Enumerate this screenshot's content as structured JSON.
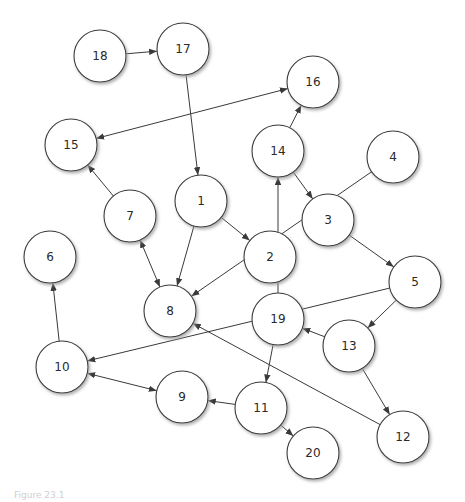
{
  "diagram": {
    "type": "directed-graph",
    "node_radius": 26,
    "colors": {
      "node_fill": "#ffffff",
      "node_stroke": "#3a3a3a",
      "edge": "#3a3a3a",
      "text": "#2a2a2a",
      "shadow": "#9a9a9a"
    },
    "nodes": [
      {
        "id": "1",
        "label": "1",
        "x": 201,
        "y": 201
      },
      {
        "id": "2",
        "label": "2",
        "x": 270,
        "y": 257
      },
      {
        "id": "3",
        "label": "3",
        "x": 328,
        "y": 220
      },
      {
        "id": "4",
        "label": "4",
        "x": 393,
        "y": 157
      },
      {
        "id": "5",
        "label": "5",
        "x": 415,
        "y": 282
      },
      {
        "id": "6",
        "label": "6",
        "x": 50,
        "y": 257
      },
      {
        "id": "7",
        "label": "7",
        "x": 130,
        "y": 216
      },
      {
        "id": "8",
        "label": "8",
        "x": 170,
        "y": 311
      },
      {
        "id": "9",
        "label": "9",
        "x": 182,
        "y": 397
      },
      {
        "id": "10",
        "label": "10",
        "x": 62,
        "y": 367
      },
      {
        "id": "11",
        "label": "11",
        "x": 261,
        "y": 408
      },
      {
        "id": "12",
        "label": "12",
        "x": 403,
        "y": 437
      },
      {
        "id": "13",
        "label": "13",
        "x": 349,
        "y": 346
      },
      {
        "id": "14",
        "label": "14",
        "x": 278,
        "y": 151
      },
      {
        "id": "15",
        "label": "15",
        "x": 71,
        "y": 145
      },
      {
        "id": "16",
        "label": "16",
        "x": 313,
        "y": 82
      },
      {
        "id": "17",
        "label": "17",
        "x": 183,
        "y": 49
      },
      {
        "id": "18",
        "label": "18",
        "x": 100,
        "y": 56
      },
      {
        "id": "19",
        "label": "19",
        "x": 278,
        "y": 319
      },
      {
        "id": "20",
        "label": "20",
        "x": 313,
        "y": 453
      }
    ],
    "edges": [
      {
        "from": "18",
        "to": "17",
        "bidirectional": false
      },
      {
        "from": "17",
        "to": "1",
        "bidirectional": false
      },
      {
        "from": "16",
        "to": "15",
        "bidirectional": true
      },
      {
        "from": "7",
        "to": "15",
        "bidirectional": false
      },
      {
        "from": "14",
        "to": "16",
        "bidirectional": false
      },
      {
        "from": "14",
        "to": "3",
        "bidirectional": false
      },
      {
        "from": "4",
        "to": "8",
        "bidirectional": false
      },
      {
        "from": "1",
        "to": "8",
        "bidirectional": false
      },
      {
        "from": "1",
        "to": "2",
        "bidirectional": false
      },
      {
        "from": "7",
        "to": "8",
        "bidirectional": true
      },
      {
        "from": "19",
        "to": "14",
        "bidirectional": false
      },
      {
        "from": "3",
        "to": "5",
        "bidirectional": false
      },
      {
        "from": "5",
        "to": "10",
        "bidirectional": false
      },
      {
        "from": "5",
        "to": "13",
        "bidirectional": false
      },
      {
        "from": "13",
        "to": "19",
        "bidirectional": false
      },
      {
        "from": "19",
        "to": "11",
        "bidirectional": false
      },
      {
        "from": "10",
        "to": "6",
        "bidirectional": false
      },
      {
        "from": "10",
        "to": "9",
        "bidirectional": true
      },
      {
        "from": "11",
        "to": "9",
        "bidirectional": false
      },
      {
        "from": "11",
        "to": "20",
        "bidirectional": false
      },
      {
        "from": "13",
        "to": "12",
        "bidirectional": false
      },
      {
        "from": "12",
        "to": "8",
        "bidirectional": false
      }
    ]
  },
  "caption": {
    "text": "Figure 23.1"
  }
}
